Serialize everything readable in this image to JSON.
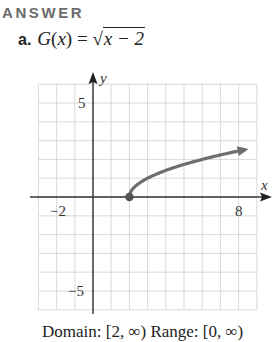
{
  "heading": "ANSWER",
  "problem": {
    "label": "a.",
    "function_name": "G",
    "variable": "x",
    "lhs_open": "(",
    "lhs_close": ")",
    "equals": "=",
    "radical": "√",
    "radicand": "x − 2"
  },
  "caption": "Domain: [2, ∞)   Range: [0, ∞)",
  "chart_data": {
    "type": "line",
    "xlabel": "x",
    "ylabel": "y",
    "xlim": [
      -3,
      9
    ],
    "ylim": [
      -6,
      6
    ],
    "grid": true,
    "x_tick_labels": [
      "-2",
      "8"
    ],
    "y_tick_labels": [
      "5",
      "-5"
    ],
    "series": [
      {
        "name": "G(x) = √(x − 2)",
        "x": [
          2,
          2.25,
          3,
          4,
          5,
          6,
          7,
          8,
          8.5
        ],
        "y": [
          0,
          0.5,
          1,
          1.41,
          1.73,
          2,
          2.24,
          2.45,
          2.55
        ],
        "start_point": {
          "x": 2,
          "y": 0,
          "style": "closed-dot"
        },
        "end": "arrow",
        "color": "#6e6e6e"
      }
    ]
  },
  "axis_labels": {
    "x": "x",
    "y": "y",
    "x_neg": "−2",
    "x_pos": "8",
    "y_pos": "5",
    "y_neg": "−5"
  }
}
